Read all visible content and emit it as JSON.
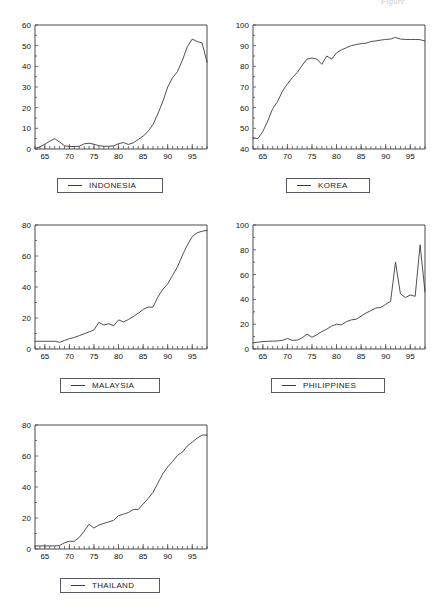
{
  "page": {
    "header_text": "Figure",
    "background": "#ffffff",
    "line_color": "#3c3c3c",
    "frame_color": "#4a4a4a",
    "text_color": "#121212"
  },
  "chart_data": [
    {
      "id": "indonesia",
      "type": "line",
      "title": "",
      "legend": "INDONESIA",
      "legend_position": "below-center",
      "grid": false,
      "xlabel": "",
      "ylabel": "",
      "xlim": [
        63,
        98
      ],
      "ylim": [
        0,
        60
      ],
      "xticks": [
        65,
        70,
        75,
        80,
        85,
        90,
        95
      ],
      "yticks": [
        0,
        10,
        20,
        30,
        40,
        50,
        60
      ],
      "x": [
        63,
        64,
        65,
        66,
        67,
        68,
        69,
        70,
        71,
        72,
        73,
        74,
        75,
        76,
        77,
        78,
        79,
        80,
        81,
        82,
        83,
        84,
        85,
        86,
        87,
        88,
        89,
        90,
        91,
        92,
        93,
        94,
        95,
        96,
        97,
        98
      ],
      "values": [
        0.3,
        1.0,
        2.3,
        3.8,
        5.0,
        3.4,
        1.6,
        1.2,
        1.2,
        1.3,
        2.5,
        2.8,
        2.3,
        1.6,
        1.3,
        1.3,
        1.5,
        2.6,
        3.1,
        2.2,
        3.0,
        4.6,
        6.2,
        8.5,
        11.8,
        17.0,
        23.0,
        30.0,
        34.5,
        37.5,
        43.0,
        49.5,
        53.2,
        52.0,
        51.3,
        42.0
      ]
    },
    {
      "id": "korea",
      "type": "line",
      "title": "",
      "legend": "KOREA",
      "legend_position": "below-center",
      "grid": false,
      "xlabel": "",
      "ylabel": "",
      "xlim": [
        63,
        98
      ],
      "ylim": [
        40,
        100
      ],
      "xticks": [
        65,
        70,
        75,
        80,
        85,
        90,
        95
      ],
      "yticks": [
        40,
        50,
        60,
        70,
        80,
        90,
        100
      ],
      "x": [
        63,
        64,
        65,
        66,
        67,
        68,
        69,
        70,
        71,
        72,
        73,
        74,
        75,
        76,
        77,
        78,
        79,
        80,
        81,
        82,
        83,
        84,
        85,
        86,
        87,
        88,
        89,
        90,
        91,
        92,
        93,
        94,
        95,
        96,
        97,
        98
      ],
      "values": [
        45.5,
        45.0,
        48.5,
        53.5,
        59.5,
        63.0,
        68.0,
        71.5,
        74.5,
        77.0,
        80.5,
        83.5,
        84.0,
        83.5,
        81.0,
        85.0,
        83.5,
        86.5,
        88.0,
        89.0,
        90.0,
        90.5,
        91.0,
        91.2,
        92.0,
        92.3,
        92.7,
        93.0,
        93.2,
        94.0,
        93.2,
        93.0,
        93.0,
        93.0,
        92.9,
        92.2
      ]
    },
    {
      "id": "malaysia",
      "type": "line",
      "title": "",
      "legend": "MALAYSIA",
      "legend_position": "below-center",
      "grid": false,
      "xlabel": "",
      "ylabel": "",
      "xlim": [
        63,
        98
      ],
      "ylim": [
        0,
        80
      ],
      "xticks": [
        65,
        70,
        75,
        80,
        85,
        90,
        95
      ],
      "yticks": [
        0,
        20,
        40,
        60,
        80
      ],
      "x": [
        63,
        64,
        65,
        66,
        67,
        68,
        69,
        70,
        71,
        72,
        73,
        74,
        75,
        76,
        77,
        78,
        79,
        80,
        81,
        82,
        83,
        84,
        85,
        86,
        87,
        88,
        89,
        90,
        91,
        92,
        93,
        94,
        95,
        96,
        97,
        98
      ],
      "values": [
        5.0,
        5.0,
        5.0,
        5.0,
        5.0,
        4.3,
        5.5,
        6.6,
        7.5,
        8.6,
        9.8,
        11.0,
        12.3,
        17.2,
        15.5,
        16.3,
        15.0,
        18.8,
        17.5,
        19.0,
        21.0,
        23.0,
        25.5,
        27.0,
        27.0,
        33.5,
        38.5,
        42.0,
        47.5,
        53.0,
        60.5,
        67.0,
        72.5,
        75.0,
        76.0,
        76.5
      ]
    },
    {
      "id": "philippines",
      "type": "line",
      "title": "",
      "legend": "PHILIPPINES",
      "legend_position": "below-center",
      "grid": false,
      "xlabel": "",
      "ylabel": "",
      "xlim": [
        63,
        98
      ],
      "ylim": [
        0,
        100
      ],
      "xticks": [
        65,
        70,
        75,
        80,
        85,
        90,
        95
      ],
      "yticks": [
        0,
        20,
        40,
        60,
        80,
        100
      ],
      "x": [
        63,
        64,
        65,
        66,
        67,
        68,
        69,
        70,
        71,
        72,
        73,
        74,
        75,
        76,
        77,
        78,
        79,
        80,
        81,
        82,
        83,
        84,
        85,
        86,
        87,
        88,
        89,
        90,
        91,
        92,
        93,
        94,
        95,
        96,
        97,
        98
      ],
      "values": [
        5.0,
        5.5,
        6.0,
        6.2,
        6.3,
        6.5,
        7.0,
        8.5,
        7.0,
        7.2,
        9.0,
        12.0,
        9.5,
        11.5,
        14.0,
        16.0,
        18.5,
        20.0,
        19.5,
        22.0,
        23.5,
        24.0,
        26.5,
        29.0,
        31.0,
        33.0,
        33.5,
        36.0,
        38.5,
        70.0,
        44.5,
        41.5,
        43.5,
        42.5,
        84.0,
        46.0
      ]
    },
    {
      "id": "thailand",
      "type": "line",
      "title": "",
      "legend": "THAILAND",
      "legend_position": "below-center",
      "grid": false,
      "xlabel": "",
      "ylabel": "",
      "xlim": [
        63,
        98
      ],
      "ylim": [
        0,
        80
      ],
      "xticks": [
        65,
        70,
        75,
        80,
        85,
        90,
        95
      ],
      "yticks": [
        0,
        20,
        40,
        60,
        80
      ],
      "x": [
        63,
        64,
        65,
        66,
        67,
        68,
        69,
        70,
        71,
        72,
        73,
        74,
        75,
        76,
        77,
        78,
        79,
        80,
        81,
        82,
        83,
        84,
        85,
        86,
        87,
        88,
        89,
        90,
        91,
        92,
        93,
        94,
        95,
        96,
        97,
        98
      ],
      "values": [
        2.0,
        2.0,
        2.0,
        2.0,
        2.0,
        2.2,
        4.0,
        5.0,
        5.0,
        7.5,
        11.5,
        16.0,
        13.5,
        15.5,
        16.5,
        17.5,
        18.5,
        21.5,
        22.5,
        23.5,
        25.5,
        25.5,
        29.0,
        32.5,
        36.5,
        42.5,
        48.5,
        53.0,
        56.5,
        60.5,
        62.5,
        66.5,
        69.0,
        71.5,
        73.5,
        73.5
      ]
    }
  ]
}
